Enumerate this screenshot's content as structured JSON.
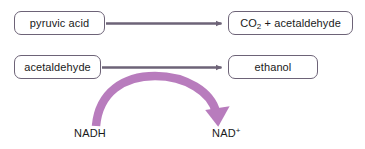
{
  "diagram": {
    "background_color": "#ffffff",
    "width": 365,
    "height": 149,
    "nodes": [
      {
        "id": "pyruvic-acid",
        "label": "pyruvic acid",
        "row": 1,
        "side": "left"
      },
      {
        "id": "co2-acetaldehyde",
        "label_html": "CO<sub>2</sub> + acetaldehyde",
        "label_text": "CO2 + acetaldehyde",
        "row": 1,
        "side": "right"
      },
      {
        "id": "acetaldehyde",
        "label": "acetaldehyde",
        "row": 2,
        "side": "left"
      },
      {
        "id": "ethanol",
        "label": "ethanol",
        "row": 2,
        "side": "right"
      }
    ],
    "reaction_arrows": [
      {
        "id": "arrow-row-1",
        "from": "pyruvic-acid",
        "to": "co2-acetaldehyde",
        "color": "#6d6377",
        "style": "straight"
      },
      {
        "id": "arrow-row-2",
        "from": "acetaldehyde",
        "to": "ethanol",
        "color": "#6d6377",
        "style": "straight"
      }
    ],
    "cofactor_arrow": {
      "id": "nadh-to-nad-arrow",
      "from_label": "NADH",
      "to_label": "NAD+",
      "to_label_html": "NAD<sup>+</sup>",
      "color": "#b87cbd",
      "style": "curved-arc"
    },
    "colors": {
      "box_border": "#6d6377",
      "box_fill": "#ffffff",
      "reaction_arrow": "#6d6377",
      "cofactor_arrow": "#b87cbd",
      "text": "#1a1a1a"
    }
  }
}
